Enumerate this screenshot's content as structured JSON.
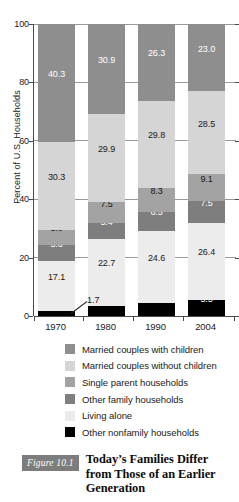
{
  "chart_data": {
    "type": "bar",
    "subtype": "stacked-bar-100",
    "title": "",
    "xlabel": "",
    "ylabel": "Percent of U.S. Households",
    "ylim": [
      0,
      100
    ],
    "yticks": [
      0,
      20,
      40,
      60,
      80,
      100
    ],
    "ytick_labels": [
      "0",
      "20",
      "40",
      "60",
      "80",
      "100"
    ],
    "grid": "horizontal",
    "legend_position": "below",
    "categories": [
      "1970",
      "1980",
      "1990",
      "2004"
    ],
    "series": [
      {
        "name": "Other nonfamily households",
        "color": "#000000",
        "label_color": "#ffffff",
        "values": [
          1.7,
          3.6,
          4.6,
          5.5
        ]
      },
      {
        "name": "Living alone",
        "color": "#ececec",
        "label_color": "#1a1a1a",
        "values": [
          17.1,
          22.7,
          24.6,
          26.4
        ]
      },
      {
        "name": "Other family households",
        "color": "#7e7e7e",
        "label_color": "#ffffff",
        "values": [
          5.6,
          5.4,
          6.5,
          7.5
        ]
      },
      {
        "name": "Single parent households",
        "color": "#a3a3a3",
        "label_color": "#1a1a1a",
        "values": [
          5.0,
          7.5,
          8.3,
          9.1
        ]
      },
      {
        "name": "Married couples without children",
        "color": "#d5d5d5",
        "label_color": "#1a1a1a",
        "values": [
          30.3,
          29.9,
          29.8,
          28.5
        ]
      },
      {
        "name": "Married couples with children",
        "color": "#8e8e8e",
        "label_color": "#ffffff",
        "values": [
          40.3,
          30.9,
          26.3,
          23.0
        ]
      }
    ],
    "annotations": [
      {
        "text": "1.7",
        "for_category": "1970",
        "for_series": "Other nonfamily households"
      }
    ]
  },
  "legend": {
    "items": [
      {
        "label": "Married couples with children",
        "color": "#8e8e8e"
      },
      {
        "label": "Married couples without children",
        "color": "#d5d5d5"
      },
      {
        "label": "Single parent households",
        "color": "#a3a3a3"
      },
      {
        "label": "Other family households",
        "color": "#7e7e7e"
      },
      {
        "label": "Living alone",
        "color": "#ececec"
      },
      {
        "label": "Other nonfamily households",
        "color": "#000000"
      }
    ]
  },
  "caption": {
    "figure_number": "Figure 10.1",
    "text": "Today’s Families Differ from Those of an Earlier Generation",
    "badge_color": "#7d7d7d"
  }
}
